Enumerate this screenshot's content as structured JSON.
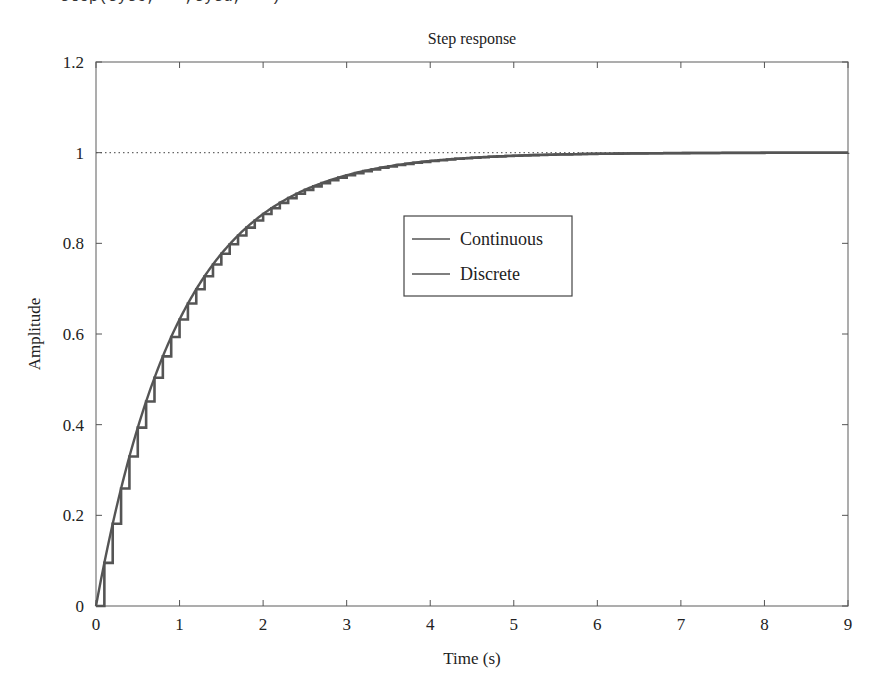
{
  "header": {
    "code_fragment": "step(sysc,'-',sysd,'-')"
  },
  "chart_data": {
    "type": "line",
    "title": "Step response",
    "xlabel": "Time (s)",
    "ylabel": "Amplitude",
    "xlim": [
      0,
      9
    ],
    "ylim": [
      0,
      1.2
    ],
    "x_ticks": [
      "0",
      "1",
      "2",
      "3",
      "4",
      "5",
      "6",
      "7",
      "8",
      "9"
    ],
    "y_ticks": [
      "0",
      "0.2",
      "0.4",
      "0.6",
      "0.8",
      "1",
      "1.2"
    ],
    "grid": false,
    "reference_line": {
      "y": 1,
      "style": "dotted"
    },
    "legend": {
      "position": "inside-center",
      "entries": [
        "Continuous",
        "Discrete"
      ]
    },
    "model": {
      "form": "1 - exp(-t/tau)",
      "tau": 1.0,
      "sample_time": 0.1
    },
    "series": [
      {
        "name": "Continuous",
        "style": "line",
        "x": [
          0,
          0.5,
          1,
          1.5,
          2,
          2.5,
          3,
          3.5,
          4,
          4.5,
          5,
          6,
          7,
          8,
          9
        ],
        "values": [
          0,
          0.39,
          0.63,
          0.78,
          0.86,
          0.92,
          0.95,
          0.97,
          0.98,
          0.99,
          0.99,
          1.0,
          1.0,
          1.0,
          1.0
        ]
      },
      {
        "name": "Discrete",
        "style": "step",
        "x": [
          0,
          0.1,
          0.2,
          0.3,
          0.4,
          0.5,
          0.6,
          0.7,
          0.8,
          0.9,
          1.0,
          1.5,
          2,
          3,
          4,
          5,
          9
        ],
        "values": [
          0,
          0.1,
          0.18,
          0.26,
          0.33,
          0.39,
          0.45,
          0.5,
          0.55,
          0.59,
          0.63,
          0.78,
          0.86,
          0.95,
          0.98,
          0.99,
          1.0
        ]
      }
    ]
  },
  "colors": {
    "curve": "#555555",
    "axis": "#555555",
    "reference": "#666666",
    "text": "#222222"
  }
}
